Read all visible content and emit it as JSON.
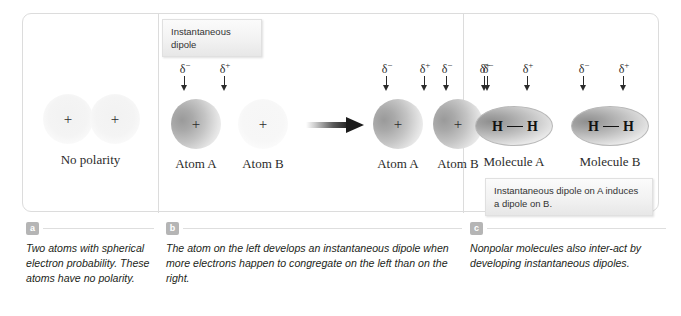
{
  "panel_a": {
    "atoms": [
      {
        "name": "atom-left",
        "charge_symbol": "+"
      },
      {
        "name": "atom-right",
        "charge_symbol": "+"
      }
    ],
    "label": "No polarity",
    "caption_badge": "a",
    "caption_text": "Two atoms with spherical electron probability. These atoms have no polarity."
  },
  "panel_b": {
    "callout": "Instantaneous dipole",
    "left_group": {
      "delta_negative": "δ",
      "delta_negative_sign": "−",
      "delta_positive": "δ",
      "delta_positive_sign": "+",
      "atom_a_label": "Atom A",
      "atom_b_label": "Atom B",
      "charge_symbol": "+"
    },
    "right_group": {
      "atom_a_label": "Atom A",
      "atom_b_label": "Atom B",
      "charge_symbol": "+"
    },
    "caption_badge": "b",
    "caption_text": "The atom on the left develops an instantaneous dipole when more electrons happen to congregate on the left than on the right."
  },
  "panel_c": {
    "molecules": [
      {
        "label": "Molecule A",
        "atom1": "H",
        "atom2": "H"
      },
      {
        "label": "Molecule B",
        "atom1": "H",
        "atom2": "H"
      }
    ],
    "callout": "Instantaneous dipole on A induces a dipole on B.",
    "caption_badge": "c",
    "caption_text": "Nonpolar molecules also inter-act by developing instantaneous dipoles."
  },
  "symbols": {
    "delta": "δ",
    "minus": "−",
    "plus": "+"
  },
  "colors": {
    "frame_border": "#dcdcdc",
    "badge_bg": "#b5b5b5",
    "text": "#231f20",
    "cloud_dark": "#9a9a9a"
  }
}
